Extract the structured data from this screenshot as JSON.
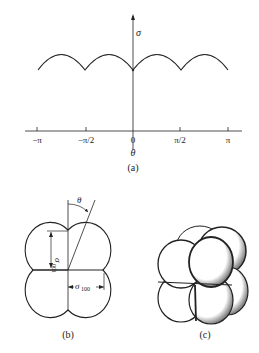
{
  "figure_a": {
    "caption": "(a)",
    "y_axis_label": "σ",
    "x_axis_label": "θ",
    "x_ticks": [
      "−π",
      "−π/2",
      "0",
      "π/2",
      "π"
    ],
    "curve": "periodic arcs with cusps at multiples of π/2"
  },
  "figure_b": {
    "caption": "(b)",
    "angle_label": "θ",
    "sigma_001_label": "σ",
    "sigma_001_sub": "001",
    "sigma_100_label": "σ",
    "sigma_100_sub": "100"
  },
  "figure_c": {
    "caption": "(c)"
  }
}
